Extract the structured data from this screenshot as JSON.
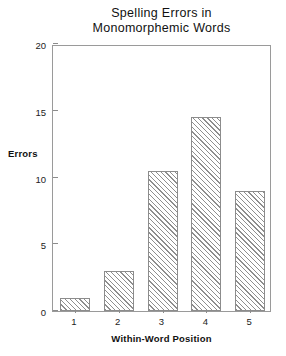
{
  "chart_data": {
    "type": "bar",
    "title": "Spelling Errors in Monomorphemic Words",
    "title_lines": [
      "Spelling Errors in",
      "Monomorphemic Words"
    ],
    "categories": [
      "1",
      "2",
      "3",
      "4",
      "5"
    ],
    "values": [
      1.0,
      3.0,
      10.5,
      14.5,
      9.0
    ],
    "xlabel": "Within-Word Position",
    "ylabel": "Errors",
    "ylim": [
      0,
      20
    ],
    "yticks": [
      0,
      5,
      10,
      15,
      20
    ],
    "ytick_labels": [
      "0",
      "5",
      "10",
      "15",
      "20"
    ],
    "grid": false,
    "legend": false,
    "bar_fill": "diagonal-hatch",
    "colors": {
      "background": "#ffffff",
      "frame": "#9a9a9a",
      "bar_edge": "#8c8c8c",
      "hatch": "#8e8e8e",
      "text": "#1a1a1a"
    }
  }
}
